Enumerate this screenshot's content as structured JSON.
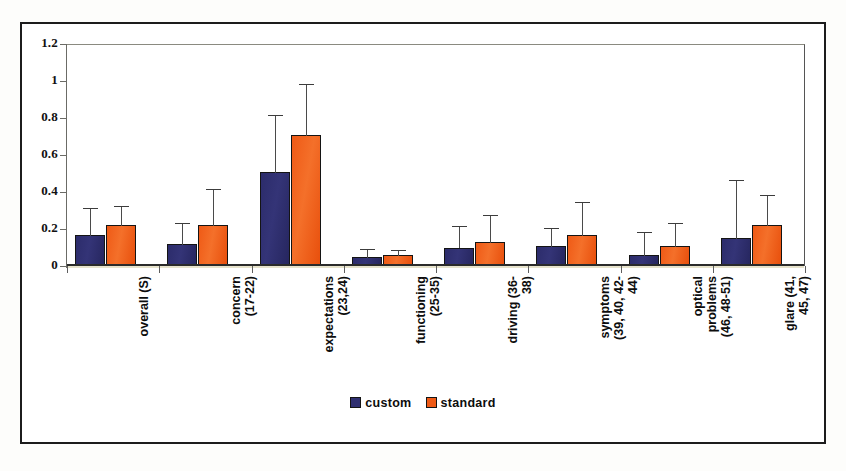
{
  "chart_data": {
    "type": "bar",
    "title": "",
    "xlabel": "",
    "ylabel": "",
    "ylim": [
      0,
      1.2
    ],
    "yticks": [
      0,
      0.2,
      0.4,
      0.6,
      0.8,
      1,
      1.2
    ],
    "ytick_labels": [
      "0",
      "0.2",
      "0.4",
      "0.6",
      "0.8",
      "1",
      "1.2"
    ],
    "grid": false,
    "legend_position": "bottom",
    "categories": [
      "overall (S)",
      "concern\n(17-22)",
      "expectations\n(23,24)",
      "functioning\n(25-35)",
      "driving (36-\n38)",
      "symptoms\n(39, 40, 42-\n44)",
      "optical\nproblems\n(46, 48-51)",
      "glare (41,\n45, 47)"
    ],
    "series": [
      {
        "name": "custom",
        "color": "#2f2f70",
        "values": [
          0.17,
          0.12,
          0.51,
          0.05,
          0.1,
          0.11,
          0.06,
          0.15
        ],
        "errors_upper": [
          0.32,
          0.24,
          0.82,
          0.1,
          0.22,
          0.21,
          0.19,
          0.47
        ]
      },
      {
        "name": "standard",
        "color": "#ef5a16",
        "values": [
          0.22,
          0.22,
          0.71,
          0.06,
          0.13,
          0.17,
          0.11,
          0.22
        ],
        "errors_upper": [
          0.33,
          0.42,
          0.99,
          0.09,
          0.28,
          0.35,
          0.24,
          0.39
        ]
      }
    ]
  },
  "legend": {
    "items": [
      {
        "label": "custom"
      },
      {
        "label": "standard"
      }
    ]
  }
}
